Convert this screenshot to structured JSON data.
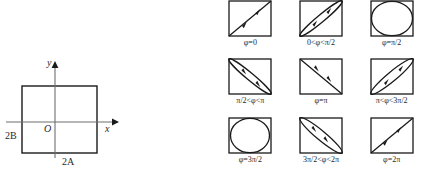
{
  "figure": {
    "stroke_color": "#1a1a1a",
    "background_color": "#ffffff"
  },
  "left_diagram": {
    "name": "amplitude-bounding-box",
    "x_axis_label": "x",
    "y_axis_label": "y",
    "origin_label": "O",
    "width_label": "2A",
    "height_label": "2B",
    "box": {
      "half_width": "A",
      "half_height": "B"
    }
  },
  "right_grid": {
    "rows": 3,
    "columns": 3,
    "cells": [
      {
        "index": 0,
        "shape": "diagonal-line",
        "caption": "φ=0",
        "arrow": "up-right"
      },
      {
        "index": 1,
        "shape": "narrow-ellipse-major-diag",
        "caption": "0<φ<π/2",
        "arrow": "up-right"
      },
      {
        "index": 2,
        "shape": "circle",
        "caption": "φ=π/2",
        "arrow": "none"
      },
      {
        "index": 3,
        "shape": "narrow-ellipse-major-antidiag",
        "caption": "π/2<φ<π",
        "arrow": "down-right"
      },
      {
        "index": 4,
        "shape": "antidiagonal-line",
        "caption": "φ=π",
        "arrow": "down-right"
      },
      {
        "index": 5,
        "shape": "narrow-ellipse-major-diag",
        "caption": "π<φ<3π/2",
        "arrow": "up-right"
      },
      {
        "index": 6,
        "shape": "circle",
        "caption": "φ=3π/2",
        "arrow": "none"
      },
      {
        "index": 7,
        "shape": "narrow-ellipse-major-antidiag",
        "caption": "3π/2<φ<2π",
        "arrow": "down-right"
      },
      {
        "index": 8,
        "shape": "diagonal-line",
        "caption": "φ=2π",
        "arrow": "up-right"
      }
    ]
  }
}
